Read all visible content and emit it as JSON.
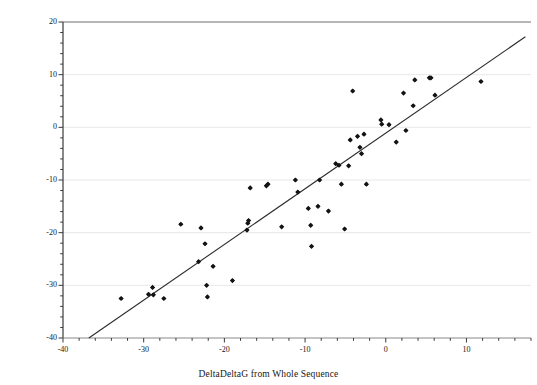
{
  "chart_data": {
    "type": "scatter",
    "title": "",
    "xlabel": "DeltaDeltaG from Whole Sequence",
    "ylabel": "Sum of UTR and CDS DeltaDelta-G",
    "xlim": [
      -40,
      18
    ],
    "ylim": [
      -40,
      20
    ],
    "xticks": [
      -40,
      -30,
      -20,
      -10,
      0,
      10
    ],
    "yticks": [
      20,
      10,
      0,
      -10,
      -20,
      -30,
      -40
    ],
    "xtick_labels": [
      "-40",
      "-30",
      "-20",
      "-10",
      "0",
      "10"
    ],
    "ytick_labels": [
      "20",
      "10",
      "0",
      "-10",
      "-20",
      "-30",
      "-40"
    ],
    "minor_xtick_interval": 2,
    "minor_ytick_interval": 2,
    "grid": "horizontal-major-only",
    "grid_color": "#e8e8e8",
    "legend": "none",
    "marker": "filled-diamond",
    "marker_color": "#141414",
    "marker_size": 4,
    "trendline": {
      "type": "linear-fit",
      "color": "#2b2b2b",
      "x_start": -36.8,
      "y_start": -40,
      "x_end": 17.3,
      "y_end": 17.2
    },
    "points": [
      {
        "x": -32.8,
        "y": -32.5
      },
      {
        "x": -29.4,
        "y": -31.7
      },
      {
        "x": -28.9,
        "y": -30.4
      },
      {
        "x": -28.8,
        "y": -31.8
      },
      {
        "x": -27.5,
        "y": -32.5
      },
      {
        "x": -25.4,
        "y": -18.4
      },
      {
        "x": -23.2,
        "y": -25.5
      },
      {
        "x": -22.9,
        "y": -19.1
      },
      {
        "x": -22.4,
        "y": -22.1
      },
      {
        "x": -22.2,
        "y": -30.0
      },
      {
        "x": -22.1,
        "y": -32.2
      },
      {
        "x": -21.4,
        "y": -26.4
      },
      {
        "x": -19.0,
        "y": -29.1
      },
      {
        "x": -17.2,
        "y": -19.5
      },
      {
        "x": -17.1,
        "y": -18.2
      },
      {
        "x": -17.0,
        "y": -17.7
      },
      {
        "x": -16.8,
        "y": -11.5
      },
      {
        "x": -14.8,
        "y": -11.1
      },
      {
        "x": -14.6,
        "y": -10.8
      },
      {
        "x": -12.9,
        "y": -18.9
      },
      {
        "x": -11.2,
        "y": -10.0
      },
      {
        "x": -10.9,
        "y": -12.3
      },
      {
        "x": -9.6,
        "y": -15.4
      },
      {
        "x": -9.3,
        "y": -18.6
      },
      {
        "x": -9.2,
        "y": -22.6
      },
      {
        "x": -8.4,
        "y": -15.0
      },
      {
        "x": -8.2,
        "y": -10.0
      },
      {
        "x": -7.1,
        "y": -15.9
      },
      {
        "x": -6.2,
        "y": -6.9
      },
      {
        "x": -5.8,
        "y": -7.2
      },
      {
        "x": -5.5,
        "y": -10.8
      },
      {
        "x": -5.1,
        "y": -19.3
      },
      {
        "x": -4.6,
        "y": -7.3
      },
      {
        "x": -4.4,
        "y": -2.4
      },
      {
        "x": -4.1,
        "y": 6.9
      },
      {
        "x": -3.5,
        "y": -1.7
      },
      {
        "x": -3.2,
        "y": -3.8
      },
      {
        "x": -3.0,
        "y": -5.0
      },
      {
        "x": -2.7,
        "y": -1.3
      },
      {
        "x": -2.4,
        "y": -10.8
      },
      {
        "x": -0.6,
        "y": 1.4
      },
      {
        "x": -0.5,
        "y": 0.6
      },
      {
        "x": 0.4,
        "y": 0.5
      },
      {
        "x": 1.3,
        "y": -2.8
      },
      {
        "x": 2.2,
        "y": 6.5
      },
      {
        "x": 2.5,
        "y": -0.6
      },
      {
        "x": 3.4,
        "y": 4.1
      },
      {
        "x": 3.6,
        "y": 9.0
      },
      {
        "x": 5.4,
        "y": 9.4
      },
      {
        "x": 5.6,
        "y": 9.4
      },
      {
        "x": 6.1,
        "y": 6.1
      },
      {
        "x": 11.8,
        "y": 8.7
      }
    ]
  }
}
